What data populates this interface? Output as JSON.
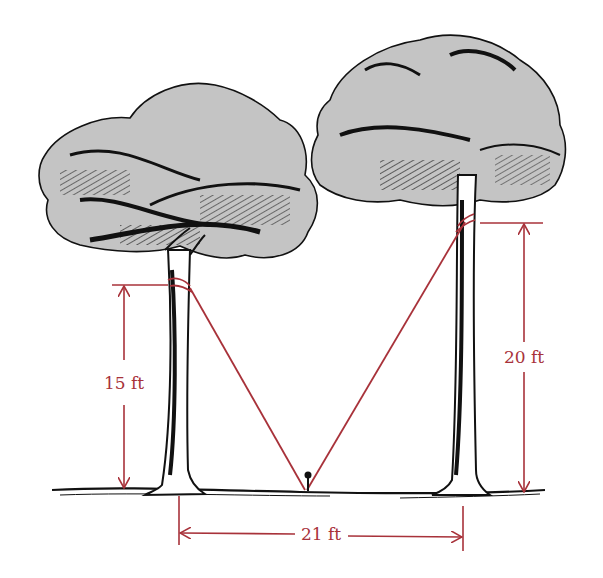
{
  "figure": {
    "colors": {
      "dimension": "#a8323a",
      "ink": "#111111",
      "canopy": "#c4c4c4",
      "background": "#ffffff"
    },
    "labels": {
      "left_height": "15 ft",
      "right_height": "20 ft",
      "base_distance": "21 ft"
    },
    "elements": {
      "left_tree": "tree",
      "right_tree": "tree",
      "stake": "ground stake",
      "ground": "ground line"
    }
  }
}
